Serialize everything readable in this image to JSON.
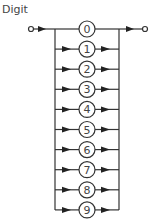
{
  "diagram": {
    "title": "Digit",
    "type": "syntax-railroad",
    "choices": [
      "0",
      "1",
      "2",
      "3",
      "4",
      "5",
      "6",
      "7",
      "8",
      "9"
    ],
    "colors": {
      "stroke": "#333333",
      "text": "#444444",
      "background": "#ffffff"
    }
  }
}
